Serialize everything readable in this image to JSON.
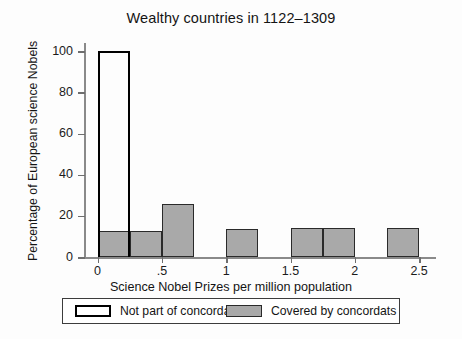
{
  "chart_data": {
    "type": "bar",
    "title": "Wealthy countries in 1122–1309",
    "xlabel": "Science Nobel Prizes per million population",
    "ylabel": "Percentage of European science Nobels",
    "xlim": [
      -0.09,
      2.6
    ],
    "ylim": [
      0,
      103
    ],
    "grid": false,
    "legend_position": "below-axes",
    "xticks": [
      "0",
      ".5",
      "1",
      "1.5",
      "2",
      "2.5"
    ],
    "xtick_values": [
      0,
      0.5,
      1,
      1.5,
      2,
      2.5
    ],
    "yticks": [
      "0",
      "20",
      "40",
      "60",
      "80",
      "100"
    ],
    "ytick_values": [
      0,
      20,
      40,
      60,
      80,
      100
    ],
    "bin_width": 0.25,
    "series": [
      {
        "name": "Not part of concordats",
        "style": "hollow",
        "color": "#ffffff",
        "edge_color": "#000000",
        "bars": [
          {
            "x_start": 0.0,
            "x_end": 0.25,
            "value": 100
          }
        ]
      },
      {
        "name": "Covered by concordats",
        "style": "filled",
        "color": "#a9a9a9",
        "edge_color": "#2a2a2a",
        "bars": [
          {
            "x_start": 0.0,
            "x_end": 0.25,
            "value": 12.8
          },
          {
            "x_start": 0.25,
            "x_end": 0.5,
            "value": 12.8
          },
          {
            "x_start": 0.5,
            "x_end": 0.75,
            "value": 25.8
          },
          {
            "x_start": 1.0,
            "x_end": 1.25,
            "value": 13.5
          },
          {
            "x_start": 1.5,
            "x_end": 1.75,
            "value": 14.0
          },
          {
            "x_start": 1.75,
            "x_end": 2.0,
            "value": 14.0
          },
          {
            "x_start": 2.25,
            "x_end": 2.5,
            "value": 14.3
          }
        ]
      }
    ]
  },
  "legend": {
    "entries": [
      {
        "label": "Not part of concordats",
        "style": "hollow"
      },
      {
        "label": "Covered by concordats",
        "style": "filled"
      }
    ]
  }
}
